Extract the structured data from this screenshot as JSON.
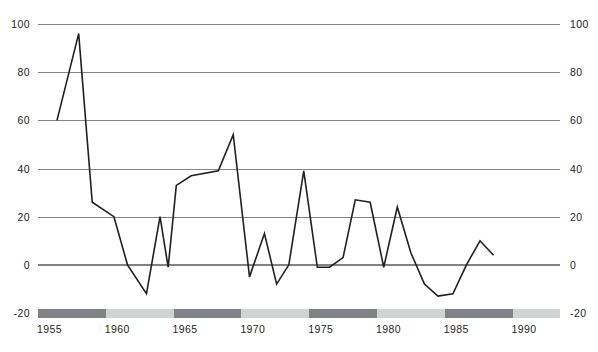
{
  "chart_data": {
    "type": "line",
    "title": "",
    "subtitle": "",
    "xlabel": "",
    "ylabel": "",
    "xlim": [
      1955,
      1993.5
    ],
    "ylim": [
      -20,
      100
    ],
    "yticks": [
      100,
      80,
      60,
      40,
      20,
      0,
      -20
    ],
    "ytick_labels": [
      "100",
      "80",
      "60",
      "40",
      "20",
      "0",
      "-20"
    ],
    "xticks": [
      1955,
      1960,
      1965,
      1970,
      1975,
      1980,
      1985,
      1990
    ],
    "xtick_labels": [
      "1955",
      "1960",
      "1965",
      "1970",
      "1975",
      "1980",
      "1985",
      "1990"
    ],
    "grid": true,
    "grid_axis": "y",
    "legend": false,
    "legend_position": "none",
    "dual_y_axis": true,
    "series": [
      {
        "name": "series-1",
        "color": "#231f20",
        "x": [
          1956.4,
          1958.0,
          1959.0,
          1960.6,
          1961.6,
          1963.0,
          1964.0,
          1964.6,
          1965.2,
          1966.3,
          1968.3,
          1969.4,
          1970.6,
          1971.7,
          1972.6,
          1973.5,
          1974.6,
          1975.6,
          1976.5,
          1977.5,
          1978.4,
          1979.5,
          1980.5,
          1981.5,
          1982.5,
          1983.5,
          1984.5,
          1985.6,
          1986.6,
          1987.6,
          1988.6
        ],
        "y": [
          60,
          96,
          26,
          20,
          0,
          -12,
          20,
          -1,
          33,
          37,
          39,
          54,
          -5,
          13,
          -8,
          0,
          39,
          -1,
          -1,
          3,
          27,
          26,
          -1,
          24,
          5,
          -8,
          -13,
          -12,
          0,
          10,
          4
        ]
      }
    ],
    "x_band": {
      "segments": [
        {
          "from": 1955.0,
          "to": 1960.0,
          "shade": "dark"
        },
        {
          "from": 1960.0,
          "to": 1965.0,
          "shade": "light"
        },
        {
          "from": 1965.0,
          "to": 1970.0,
          "shade": "dark"
        },
        {
          "from": 1970.0,
          "to": 1975.0,
          "shade": "light"
        },
        {
          "from": 1975.0,
          "to": 1980.0,
          "shade": "dark"
        },
        {
          "from": 1980.0,
          "to": 1985.0,
          "shade": "light"
        },
        {
          "from": 1985.0,
          "to": 1990.0,
          "shade": "dark"
        },
        {
          "from": 1990.0,
          "to": 1993.5,
          "shade": "light"
        }
      ],
      "dark_color": "#808285",
      "light_color": "#d1d3d4"
    },
    "colors": {
      "line": "#231f20",
      "gridline": "#6d6e71",
      "zero_line": "#808285",
      "text": "#231f20",
      "background": "#ffffff"
    }
  }
}
